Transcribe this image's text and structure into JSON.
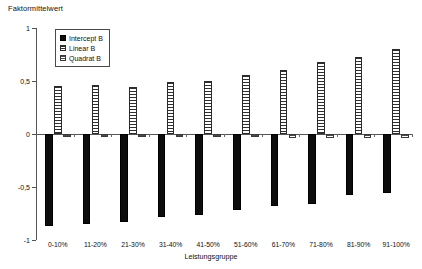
{
  "chart_data": {
    "type": "bar",
    "title": "",
    "ylabel": "Faktormittelwert",
    "xlabel": "Leistungsgruppe",
    "ylim": [
      -1,
      1
    ],
    "yticks": [
      1,
      0.5,
      0,
      -0.5,
      -1
    ],
    "ytick_labels": [
      "1",
      "0,5",
      "0",
      "-0,5",
      "-1"
    ],
    "grid": false,
    "legend_position": "upper-left-inside",
    "categories": [
      "0-10%",
      "11-20%",
      "21-30%",
      "31-40%",
      "41-50%",
      "51-60%",
      "61-70%",
      "71-80%",
      "81-90%",
      "91-100%"
    ],
    "series": [
      {
        "name": "Intercept B",
        "values": [
          -0.87,
          -0.85,
          -0.83,
          -0.78,
          -0.76,
          -0.72,
          -0.68,
          -0.66,
          -0.58,
          -0.56
        ]
      },
      {
        "name": "Linear B",
        "values": [
          0.45,
          0.46,
          0.44,
          0.49,
          0.5,
          0.56,
          0.6,
          0.68,
          0.73,
          0.8
        ]
      },
      {
        "name": "Quadrat B",
        "values": [
          -0.03,
          -0.03,
          -0.03,
          -0.03,
          -0.03,
          -0.03,
          -0.04,
          -0.04,
          -0.04,
          -0.04
        ]
      }
    ]
  },
  "legend": {
    "items": [
      {
        "label": "Intercept B",
        "swatch": "solid-black-square"
      },
      {
        "label": "Linear B",
        "swatch": "horizontal-hatch-square"
      },
      {
        "label": "Quadrat B",
        "swatch": "fine-hatch-square"
      }
    ]
  }
}
